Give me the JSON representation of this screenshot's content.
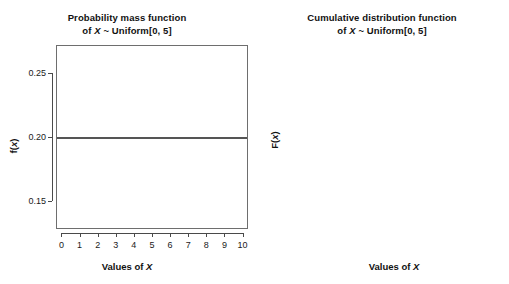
{
  "figure": {
    "background": "#ffffff",
    "panel_count": 2
  },
  "chart_data": [
    {
      "type": "line",
      "id": "pmf",
      "title": "Probability mass function",
      "subtitle": "of X ~ Uniform[0, 5]",
      "title_line1": "Probability mass function",
      "title_line2_prefix": "of ",
      "title_line2_var": "X",
      "title_line2_suffix": " ~ Uniform[0, 5]",
      "xlabel_prefix": "Values of ",
      "xlabel_var": "X",
      "ylabel_prefix": "f(",
      "ylabel_var": "x",
      "ylabel_suffix": ")",
      "x": [
        0,
        10
      ],
      "values": [
        0.2,
        0.2
      ],
      "xlim": [
        -0.3,
        10.3
      ],
      "ylim": [
        0.128,
        0.272
      ],
      "xticks": [
        0,
        1,
        2,
        3,
        4,
        5,
        6,
        7,
        8,
        9,
        10
      ],
      "xticklabels": [
        "0",
        "1",
        "2",
        "3",
        "4",
        "5",
        "6",
        "7",
        "8",
        "9",
        "10"
      ],
      "yticks": [
        0.15,
        0.2,
        0.25
      ],
      "yticklabels": [
        "0.15",
        "0.20",
        "0.25"
      ],
      "grid": false,
      "legend": false,
      "line_color": "#555555",
      "line_width": 1.6
    },
    {
      "type": "line",
      "id": "cdf",
      "title": "Cumulative distribution function",
      "subtitle": "of X ~ Uniform[0, 5]",
      "title_line1": "Cumulative distribution function",
      "title_line2_prefix": "of ",
      "title_line2_var": "X",
      "title_line2_suffix": " ~ Uniform[0, 5]",
      "xlabel_prefix": "Values of ",
      "xlabel_var": "X",
      "ylabel_prefix": "F(",
      "ylabel_var": "x",
      "ylabel_suffix": ")",
      "x": [
        0,
        5
      ],
      "values": [
        0.0,
        1.0
      ],
      "xlim": [
        -0.15,
        5.15
      ],
      "ylim": [
        -0.04,
        1.04
      ],
      "xticks": [
        0,
        1,
        2,
        3,
        4,
        5
      ],
      "xticklabels": [
        "0",
        "1",
        "2",
        "3",
        "4",
        "5"
      ],
      "yticks": [
        0.0,
        0.2,
        0.4,
        0.6,
        0.8,
        1.0
      ],
      "yticklabels": [
        "0.0",
        "0.2",
        "0.4",
        "0.6",
        "0.8",
        "1.0"
      ],
      "grid": false,
      "legend": false,
      "line_color": "#d4d4d4",
      "line_width": 1.4
    }
  ],
  "colors": {
    "axis": "#4a4a4a",
    "box": "#6e6e6e",
    "text": "#1a1a1a",
    "pmf_line": "#555555",
    "cdf_line": "#d4d4d4"
  }
}
